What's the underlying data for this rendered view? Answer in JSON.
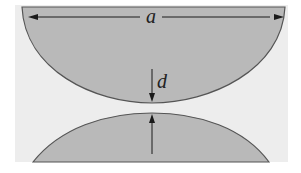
{
  "figure": {
    "labels": {
      "width": "a",
      "gap": "d"
    },
    "colors": {
      "background": "#ededed",
      "surface_fill": "#b9b9b9",
      "outline": "#555555",
      "arrow": "#1a1a1a"
    }
  }
}
